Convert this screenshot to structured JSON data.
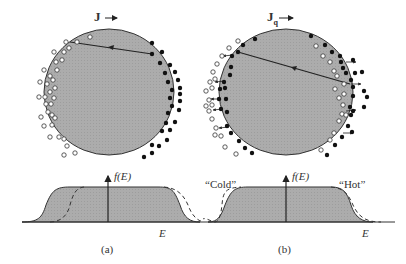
{
  "figure": {
    "panels": [
      {
        "id": "a",
        "caption": "(a)",
        "flux_label": "J",
        "flux_subscript": "",
        "axis_label_y": "f(E)",
        "axis_label_x": "E",
        "fermi_sphere": "shifted (current-carrying), occupied states displaced to the right",
        "distribution": "solid filled Fermi function with dashed curve shifted to the right"
      },
      {
        "id": "b",
        "caption": "(b)",
        "flux_label": "J",
        "flux_subscript": "q",
        "axis_label_y": "f(E)",
        "axis_label_x": "E",
        "left_label": "“Cold”",
        "right_label": "“Hot”",
        "fermi_sphere": "heat current: hot electrons on right, cold on left, with scattering arrows",
        "distribution": "solid filled Fermi function with dashed curve sharper on left (cold) and broader on right (hot)"
      }
    ],
    "colors": {
      "sphere_fill": "#a9a9a9",
      "outline": "#333333",
      "filled_dot": "#111111",
      "open_dot": "#ffffff"
    }
  }
}
